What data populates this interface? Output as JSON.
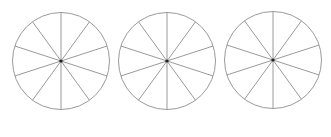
{
  "diagram": {
    "line_color": "#9a9a9a",
    "center_dot_color": "#222222",
    "background": "#ffffff",
    "circles": [
      {
        "cx": 61,
        "cy": 61,
        "r": 48.5,
        "sectors": 10
      },
      {
        "cx": 167,
        "cy": 61,
        "r": 48.5,
        "sectors": 10
      },
      {
        "cx": 273,
        "cy": 60,
        "r": 48.5,
        "sectors": 10
      }
    ]
  }
}
